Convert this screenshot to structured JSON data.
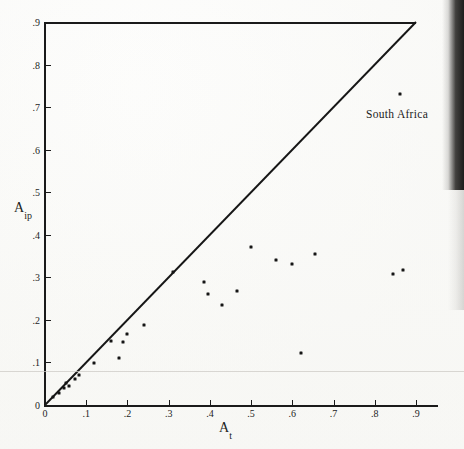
{
  "chart_data": {
    "type": "scatter",
    "title": "",
    "xlabel": "A_t",
    "ylabel": "A_ip",
    "xlabel_base": "A",
    "xlabel_sub": "t",
    "ylabel_base": "A",
    "ylabel_sub": "ip",
    "xlim": [
      0,
      0.9
    ],
    "ylim": [
      0,
      0.9
    ],
    "grid": false,
    "legend": null,
    "xticks": [
      0,
      0.1,
      0.2,
      0.3,
      0.4,
      0.5,
      0.6,
      0.7,
      0.8,
      0.9
    ],
    "yticks": [
      0,
      0.1,
      0.2,
      0.3,
      0.4,
      0.5,
      0.6,
      0.7,
      0.8,
      0.9
    ],
    "xticklabels": [
      "0",
      ".1",
      ".2",
      ".3",
      ".4",
      ".5",
      ".6",
      ".7",
      ".8",
      ".9"
    ],
    "yticklabels": [
      "0",
      ".1",
      ".2",
      ".3",
      ".4",
      ".5",
      ".6",
      ".7",
      ".8",
      ".9"
    ],
    "reference_line": {
      "name": "identity-line",
      "type": "line",
      "from": [
        0,
        0
      ],
      "to": [
        0.9,
        0.9
      ],
      "label": "45-degree line"
    },
    "points": [
      {
        "x": 0.02,
        "y": 0.018
      },
      {
        "x": 0.033,
        "y": 0.028
      },
      {
        "x": 0.045,
        "y": 0.04
      },
      {
        "x": 0.052,
        "y": 0.052
      },
      {
        "x": 0.058,
        "y": 0.044
      },
      {
        "x": 0.072,
        "y": 0.062
      },
      {
        "x": 0.083,
        "y": 0.07
      },
      {
        "x": 0.12,
        "y": 0.098
      },
      {
        "x": 0.16,
        "y": 0.15
      },
      {
        "x": 0.18,
        "y": 0.11
      },
      {
        "x": 0.19,
        "y": 0.148
      },
      {
        "x": 0.2,
        "y": 0.168
      },
      {
        "x": 0.24,
        "y": 0.188
      },
      {
        "x": 0.31,
        "y": 0.312
      },
      {
        "x": 0.385,
        "y": 0.29
      },
      {
        "x": 0.395,
        "y": 0.262
      },
      {
        "x": 0.43,
        "y": 0.235
      },
      {
        "x": 0.465,
        "y": 0.268
      },
      {
        "x": 0.5,
        "y": 0.372
      },
      {
        "x": 0.56,
        "y": 0.34
      },
      {
        "x": 0.6,
        "y": 0.332
      },
      {
        "x": 0.62,
        "y": 0.122
      },
      {
        "x": 0.655,
        "y": 0.355
      },
      {
        "x": 0.845,
        "y": 0.308
      },
      {
        "x": 0.868,
        "y": 0.318
      },
      {
        "x": 0.86,
        "y": 0.73,
        "label": "South Africa"
      }
    ],
    "annotations": [
      {
        "text": "South Africa",
        "x": 0.86,
        "y": 0.73,
        "position": "below-right"
      }
    ]
  },
  "annotation": {
    "south_africa": "South Africa"
  }
}
